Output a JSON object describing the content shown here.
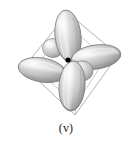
{
  "figure": {
    "caption": "(v)",
    "background_color": "#ffffff",
    "nucleus": {
      "label": "nucleus-dot",
      "color": "#000000",
      "x": 68,
      "y": 60,
      "radius": 2.6
    },
    "cube_outline": {
      "label": "tilted-cube-frame",
      "stroke_color": "#9a9a9a",
      "stroke_width": 0.8,
      "corners": [
        {
          "name": "top",
          "x": 68,
          "y": 13
        },
        {
          "name": "right",
          "x": 118,
          "y": 55
        },
        {
          "name": "bottom",
          "x": 75,
          "y": 115
        },
        {
          "name": "left",
          "x": 24,
          "y": 67
        }
      ],
      "inner_corners": [
        {
          "name": "inner-top",
          "x": 66,
          "y": 24
        },
        {
          "name": "inner-right",
          "x": 106,
          "y": 58
        },
        {
          "name": "inner-bottom",
          "x": 76,
          "y": 104
        },
        {
          "name": "inner-left",
          "x": 35,
          "y": 69
        }
      ]
    },
    "lobes": [
      {
        "name": "lobe-upper",
        "direction": "up",
        "cx": 68,
        "cy": 36,
        "rx": 13,
        "ry": 26,
        "rotation": -6,
        "fill_light": "#f2f2f2",
        "fill_mid": "#c9c9c9",
        "fill_dark": "#8f8f8f",
        "stroke": "#7a7a7a"
      },
      {
        "name": "lobe-right",
        "direction": "right",
        "cx": 96,
        "cy": 57,
        "rx": 25,
        "ry": 12,
        "rotation": -8,
        "fill_light": "#f0f0f0",
        "fill_mid": "#c4c4c4",
        "fill_dark": "#8a8a8a",
        "stroke": "#777777"
      },
      {
        "name": "lobe-lower",
        "direction": "down",
        "cx": 72,
        "cy": 86,
        "rx": 13,
        "ry": 25,
        "rotation": 4,
        "fill_light": "#f0f0f0",
        "fill_mid": "#c6c6c6",
        "fill_dark": "#8b8b8b",
        "stroke": "#787878"
      },
      {
        "name": "lobe-left",
        "direction": "left",
        "cx": 42,
        "cy": 70,
        "rx": 24,
        "ry": 12,
        "rotation": 10,
        "fill_light": "#efefef",
        "fill_mid": "#c2c2c2",
        "fill_dark": "#878787",
        "stroke": "#757575"
      },
      {
        "name": "lobe-back-upper-left",
        "direction": "back",
        "cx": 53,
        "cy": 48,
        "rx": 10,
        "ry": 9,
        "rotation": 0,
        "fill_light": "#f4f4f4",
        "fill_mid": "#cecece",
        "fill_dark": "#999999",
        "stroke": "#808080"
      },
      {
        "name": "lobe-front-lower-right",
        "direction": "front",
        "cx": 82,
        "cy": 71,
        "rx": 11,
        "ry": 10,
        "rotation": 0,
        "fill_light": "#f4f4f4",
        "fill_mid": "#cbcbcb",
        "fill_dark": "#959595",
        "stroke": "#7e7e7e"
      }
    ]
  }
}
